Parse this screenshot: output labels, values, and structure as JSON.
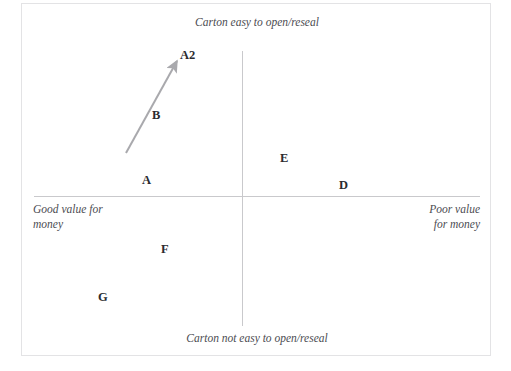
{
  "chart_data": {
    "type": "scatter",
    "title": "",
    "subtitle": "",
    "xlabel": "",
    "ylabel": "",
    "grid": false,
    "legend": false,
    "axes": {
      "horizontal": {
        "left_pole": "Good value for\nmoney",
        "right_pole": "Poor value\nfor money"
      },
      "vertical": {
        "top_pole": "Carton easy to open/reseal",
        "bottom_pole": "Carton not easy to open/reseal"
      }
    },
    "xlim": [
      -1,
      1
    ],
    "ylim": [
      -1,
      1
    ],
    "points": [
      {
        "label": "A2",
        "x": -0.28,
        "y": 0.76
      },
      {
        "label": "B",
        "x": -0.41,
        "y": 0.39
      },
      {
        "label": "A",
        "x": -0.45,
        "y": 0.1
      },
      {
        "label": "E",
        "x": 0.1,
        "y": 0.21
      },
      {
        "label": "D",
        "x": 0.37,
        "y": 0.06
      },
      {
        "label": "F",
        "x": -0.36,
        "y": -0.3
      },
      {
        "label": "G",
        "x": -0.64,
        "y": -0.57
      }
    ],
    "annotations": [
      {
        "type": "arrow",
        "from_label": "A",
        "to_label": "A2",
        "note": "movement of brand A to repositioned A2"
      }
    ]
  },
  "map": {
    "top_pole_label": "Carton easy to open/reseal",
    "bottom_pole_label": "Carton not easy to open/reseal",
    "left_pole_label": "Good value for\nmoney",
    "right_pole_label": "Poor value\nfor money",
    "brands": [
      {
        "name": "A2",
        "left": 158,
        "top": 45
      },
      {
        "name": "B",
        "left": 130,
        "top": 105
      },
      {
        "name": "A",
        "left": 120,
        "top": 170
      },
      {
        "name": "E",
        "left": 258,
        "top": 148
      },
      {
        "name": "D",
        "left": 317,
        "top": 175
      },
      {
        "name": "F",
        "left": 139,
        "top": 239
      },
      {
        "name": "G",
        "left": 76,
        "top": 287
      }
    ]
  },
  "colors": {
    "frame_border": "#e3e3e5",
    "axis_line": "#c9c9cc",
    "arrow": "#a9a9ad",
    "pole_text": "#4c4c52",
    "brand_text": "#2b2b2f",
    "background": "#ffffff"
  },
  "arrow": {
    "start_x": 125,
    "start_y": 152,
    "end_x": 176,
    "end_y": 60
  }
}
